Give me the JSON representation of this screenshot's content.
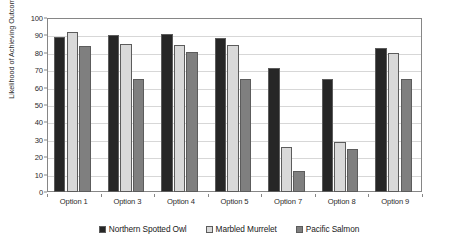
{
  "chart_data": {
    "type": "bar",
    "title": "",
    "subtitle": "",
    "xlabel": "",
    "ylabel": "Likelihood of Achieving Outcome A",
    "ylim": [
      0,
      100
    ],
    "ytick_step": 10,
    "yticks": [
      "0",
      "10",
      "20",
      "30",
      "40",
      "50",
      "60",
      "70",
      "80",
      "90",
      "100"
    ],
    "grid": true,
    "grid_axis": "y",
    "legend_position": "bottom",
    "categories": [
      "Option 1",
      "Option 3",
      "Option 4",
      "Option 5",
      "Option 7",
      "Option 8",
      "Option 9"
    ],
    "series": [
      {
        "name": "Northern Spotted Owl",
        "color": "#262626",
        "values": [
          89,
          90,
          91,
          88.5,
          71,
          65,
          83
        ]
      },
      {
        "name": "Marbled Murrelet",
        "color": "#D9D9D9",
        "values": [
          92,
          85,
          84.5,
          84.5,
          26,
          29,
          80
        ]
      },
      {
        "name": "Pacific Salmon",
        "color": "#7F7F7F",
        "values": [
          84,
          65,
          80.5,
          65,
          12,
          25,
          65
        ]
      }
    ]
  },
  "axis": {
    "y_title": "Likelihood of Achieving Outcome A"
  },
  "legend": {
    "items": [
      {
        "label": "Northern Spotted Owl",
        "swatch": "legend-swatch-black"
      },
      {
        "label": "Marbled Murrelet",
        "swatch": "legend-swatch-light-gray"
      },
      {
        "label": "Pacific Salmon",
        "swatch": "legend-swatch-medium-gray"
      }
    ]
  },
  "colors": {
    "series_1": "#262626",
    "series_2": "#D9D9D9",
    "series_3": "#7F7F7F",
    "gridline": "#D7D7D7",
    "axis_line": "#868686",
    "bar_outline": "#5C5C5C",
    "text": "#2B2B2B",
    "background": "#FFFFFF"
  }
}
